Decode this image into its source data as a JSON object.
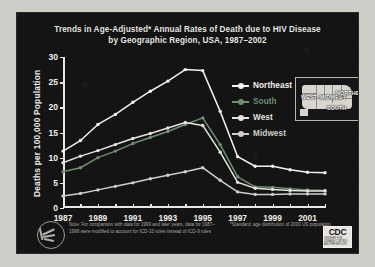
{
  "slide": {
    "title_line1": "Trends in Age-Adjusted* Annual Rates of Death due to HIV Disease",
    "title_line2": "by Geographic Region, USA, 1987–2002",
    "note_left": "Note: For comparison with data for 1999 and later years, data for 1987–1998 were modified to account for ICD-10 rules instead of ICD-9 rules",
    "note_right": "*Standard: age distribution of 2000 US population",
    "cdc_logo": "CDC",
    "cdc_sub": "CENTERS FOR DISEASE CONTROL AND PREVENTION",
    "map_labels": [
      "WEST",
      "MIDWEST",
      "NORTHEAST",
      "SOUTH"
    ]
  },
  "colors": {
    "background": "#141414",
    "axis": "#e9e8e3",
    "text": "#efeeea",
    "northeast": "#f2f1ec",
    "south": "#6f8f72",
    "west": "#e4e3de",
    "midwest": "#cfcec9",
    "note": "#a9a7a1"
  },
  "chart_data": {
    "type": "line",
    "title": "Trends in Age-Adjusted* Annual Rates of Death due to HIV Disease by Geographic Region, USA, 1987–2002",
    "xlabel": "",
    "ylabel": "Deaths per 100,000 Population",
    "x": [
      1987,
      1988,
      1989,
      1990,
      1991,
      1992,
      1993,
      1994,
      1995,
      1996,
      1997,
      1998,
      1999,
      2000,
      2001,
      2002
    ],
    "xlim": [
      1987,
      2002
    ],
    "ylim": [
      0,
      30
    ],
    "yticks": [
      0,
      5,
      10,
      15,
      20,
      25,
      30
    ],
    "xticks_labeled": [
      1987,
      1989,
      1991,
      1993,
      1995,
      1997,
      1999,
      2001
    ],
    "grid": false,
    "legend_position": "upper right",
    "series": [
      {
        "name": "Northeast",
        "color": "#f2f1ec",
        "values": [
          11.3,
          13.4,
          16.6,
          18.6,
          21.0,
          23.2,
          25.2,
          27.5,
          27.3,
          19.2,
          10.2,
          8.3,
          8.3,
          7.6,
          7.1,
          7.0
        ]
      },
      {
        "name": "South",
        "color": "#6f8f72",
        "values": [
          7.2,
          8.0,
          10.0,
          11.3,
          12.8,
          14.0,
          15.2,
          16.6,
          17.9,
          12.6,
          6.2,
          4.2,
          4.1,
          3.8,
          3.6,
          3.5
        ]
      },
      {
        "name": "West",
        "color": "#e4e3de",
        "values": [
          9.0,
          10.3,
          11.4,
          12.6,
          13.8,
          14.8,
          15.9,
          17.0,
          16.4,
          11.1,
          5.1,
          3.9,
          3.7,
          3.5,
          3.4,
          3.4
        ]
      },
      {
        "name": "Midwest",
        "color": "#cfcec9",
        "values": [
          2.4,
          2.9,
          3.6,
          4.3,
          5.0,
          5.8,
          6.5,
          7.2,
          8.0,
          5.5,
          3.2,
          2.7,
          2.7,
          2.8,
          2.8,
          2.8
        ]
      }
    ]
  }
}
